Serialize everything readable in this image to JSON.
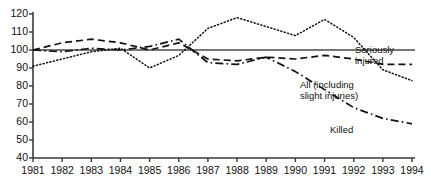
{
  "chart_data": {
    "type": "line",
    "title": "",
    "xlabel": "",
    "ylabel": "",
    "x": [
      1981,
      1982,
      1983,
      1984,
      1985,
      1986,
      1987,
      1988,
      1989,
      1990,
      1991,
      1992,
      1993,
      1994
    ],
    "xtick_labels": [
      "1981",
      "1982",
      "1983",
      "1984",
      "1985",
      "1986",
      "1987",
      "1988",
      "1989",
      "1990",
      "1991",
      "1992",
      "1993",
      "1994"
    ],
    "ytick_labels": [
      "120",
      "110",
      "100",
      "90",
      "80",
      "70",
      "60",
      "50",
      "40"
    ],
    "yticks": [
      120,
      110,
      100,
      90,
      80,
      70,
      60,
      50,
      40
    ],
    "xlim": [
      1981,
      1994
    ],
    "ylim": [
      40,
      120
    ],
    "grid": false,
    "legend_position": "inline-right",
    "baseline_value": 100,
    "series": [
      {
        "name": "Seriously injured",
        "style": "dotted",
        "label_text": "Seriously\ninjured",
        "values": [
          91,
          95,
          99,
          101,
          90,
          97,
          112,
          118,
          113,
          108,
          117,
          107,
          89,
          83
        ]
      },
      {
        "name": "All (including slight injuries)",
        "style": "dashed",
        "label_text": "All (including\nslight injuries)",
        "values": [
          100,
          104,
          106,
          104,
          100,
          104,
          95,
          94,
          96,
          95,
          97,
          95,
          92,
          92
        ]
      },
      {
        "name": "Killed",
        "style": "dash-dot",
        "label_text": "Killed",
        "values": [
          100,
          99,
          101,
          100,
          102,
          106,
          93,
          92,
          96,
          88,
          78,
          68,
          62,
          59
        ]
      }
    ],
    "colors": {
      "axis": "#3a3a3a",
      "line": "#111111",
      "baseline": "#4a4a4a",
      "text": "#111111"
    }
  }
}
